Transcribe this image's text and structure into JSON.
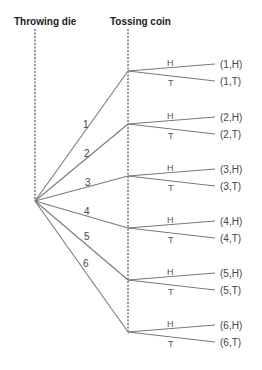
{
  "headers": {
    "stage1": "Throwing die",
    "stage2": "Tossing coin"
  },
  "colors": {
    "edge": "#7a7a7a",
    "text": "#444444",
    "header": "#1a1a1a"
  },
  "tree": {
    "root": {
      "x": 35,
      "y": 201
    },
    "die_branches": [
      {
        "label": "1",
        "node_y": 71,
        "label_x": 83,
        "label_y": 128
      },
      {
        "label": "2",
        "node_y": 124,
        "label_x": 84,
        "label_y": 157
      },
      {
        "label": "3",
        "node_y": 176,
        "label_x": 85,
        "label_y": 186
      },
      {
        "label": "4",
        "node_y": 228,
        "label_x": 84,
        "label_y": 215
      },
      {
        "label": "5",
        "node_y": 280,
        "label_x": 84,
        "label_y": 240
      },
      {
        "label": "6",
        "node_y": 332,
        "label_x": 83,
        "label_y": 267
      }
    ],
    "coin_labels": {
      "heads": "H",
      "tails": "T"
    },
    "outcomes": [
      {
        "heads": "(1,H)",
        "tails": "(1,T)"
      },
      {
        "heads": "(2,H)",
        "tails": "(2,T)"
      },
      {
        "heads": "(3,H)",
        "tails": "(3,T)"
      },
      {
        "heads": "(4,H)",
        "tails": "(4,T)"
      },
      {
        "heads": "(5,H)",
        "tails": "(5,T)"
      },
      {
        "heads": "(6,H)",
        "tails": "(6,T)"
      }
    ]
  }
}
